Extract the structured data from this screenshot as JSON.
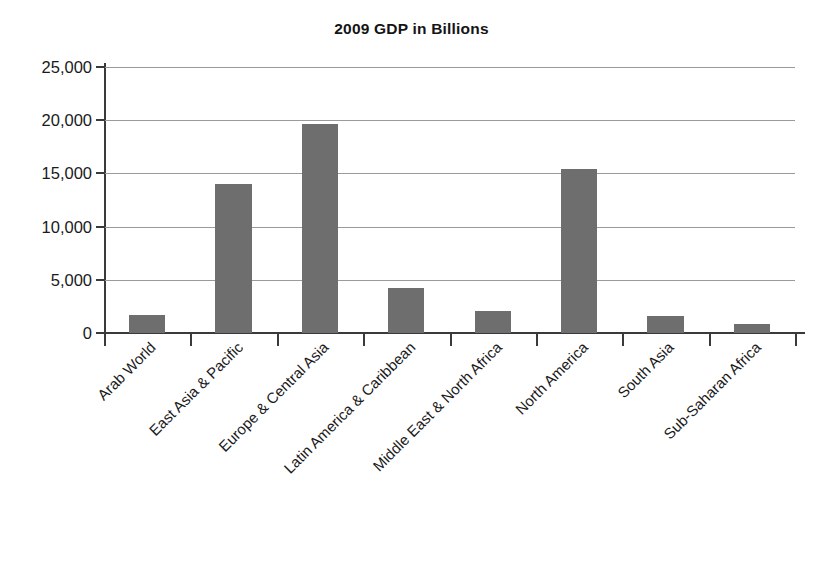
{
  "chart_data": {
    "type": "bar",
    "title": "2009 GDP in Billions",
    "xlabel": "",
    "ylabel": "",
    "ylim": [
      0,
      25000
    ],
    "yticks": [
      0,
      5000,
      10000,
      15000,
      20000,
      25000
    ],
    "ytick_labels": [
      "0",
      "5,000",
      "10,000",
      "15,000",
      "20,000",
      "25,000"
    ],
    "grid": true,
    "legend": "none",
    "bar_color": "#6e6e6e",
    "categories": [
      "Arab World",
      "East Asia & Pacific",
      "Europe & Central Asia",
      "Latin America & Caribbean",
      "Middle East & North Africa",
      "North America",
      "South Asia",
      "Sub-Saharan Africa"
    ],
    "values": [
      1700,
      14000,
      19600,
      4200,
      2050,
      15400,
      1600,
      850
    ]
  }
}
